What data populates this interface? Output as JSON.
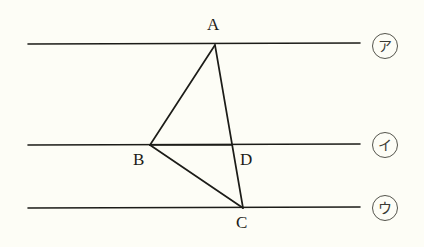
{
  "figure": {
    "background_color": "#fdfdf6",
    "stroke_color": "#1c1c18",
    "vertices": [
      {
        "id": "A",
        "label": "A",
        "x": 215,
        "y": 45,
        "label_x": 207,
        "label_y": 16
      },
      {
        "id": "B",
        "label": "B",
        "x": 150,
        "y": 145,
        "label_x": 133,
        "label_y": 151
      },
      {
        "id": "C",
        "label": "C",
        "x": 243,
        "y": 208,
        "label_x": 236,
        "label_y": 214
      },
      {
        "id": "D",
        "label": "D",
        "x": 232,
        "y": 145,
        "label_x": 240,
        "label_y": 151
      }
    ],
    "segments": [
      {
        "name": "segment-AB",
        "from": "A",
        "to": "B",
        "x1": 215,
        "y1": 45,
        "x2": 150,
        "y2": 145
      },
      {
        "name": "segment-AC",
        "from": "A",
        "to": "C",
        "x1": 215,
        "y1": 45,
        "x2": 243,
        "y2": 208
      },
      {
        "name": "segment-BC",
        "from": "B",
        "to": "C",
        "x1": 150,
        "y1": 145,
        "x2": 243,
        "y2": 208
      },
      {
        "name": "segment-BD",
        "from": "B",
        "to": "D",
        "x1": 150,
        "y1": 145,
        "x2": 232,
        "y2": 145
      }
    ],
    "parallel_lines": [
      {
        "name": "line-a",
        "tag": "ア",
        "tag_label": "circled-katakana-a",
        "x1": 28,
        "y1": 44,
        "x2": 360,
        "y2": 43,
        "tag_x": 372,
        "tag_y": 33
      },
      {
        "name": "line-i",
        "tag": "イ",
        "tag_label": "circled-katakana-i",
        "x1": 28,
        "y1": 145,
        "x2": 360,
        "y2": 144,
        "tag_x": 372,
        "tag_y": 132
      },
      {
        "name": "line-u",
        "tag": "ウ",
        "tag_label": "circled-katakana-u",
        "x1": 28,
        "y1": 208,
        "x2": 360,
        "y2": 207,
        "tag_x": 372,
        "tag_y": 195
      }
    ]
  }
}
